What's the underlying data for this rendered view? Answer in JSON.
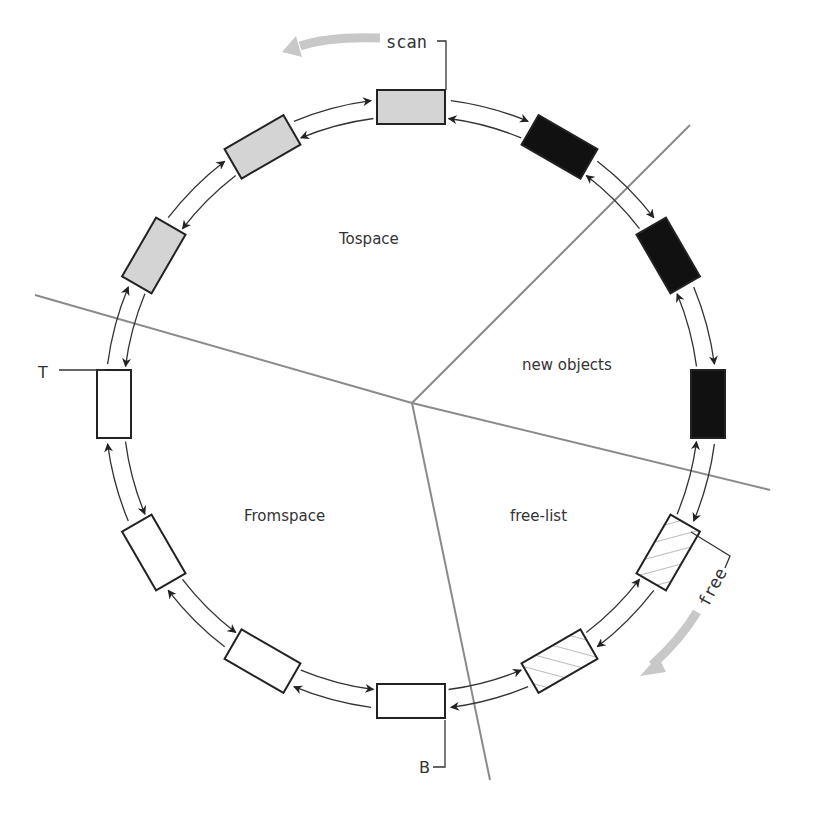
{
  "diagram": {
    "regions": [
      {
        "id": "tospace",
        "label": "Tospace"
      },
      {
        "id": "new-objects",
        "label": "new objects"
      },
      {
        "id": "free-list",
        "label": "free-list"
      },
      {
        "id": "fromspace",
        "label": "Fromspace"
      }
    ],
    "pointers": {
      "scan": "scan",
      "free": "free",
      "top": "T",
      "bottom": "B"
    },
    "blocks": [
      {
        "index": 0,
        "angle": -90,
        "fill": "grey",
        "region": "tospace"
      },
      {
        "index": 1,
        "angle": -60,
        "fill": "black",
        "region": "new-objects"
      },
      {
        "index": 2,
        "angle": -30,
        "fill": "black",
        "region": "new-objects"
      },
      {
        "index": 3,
        "angle": 0,
        "fill": "black",
        "region": "new-objects"
      },
      {
        "index": 4,
        "angle": 30,
        "fill": "hatched",
        "region": "free-list"
      },
      {
        "index": 5,
        "angle": 60,
        "fill": "hatched",
        "region": "free-list"
      },
      {
        "index": 6,
        "angle": 90,
        "fill": "white",
        "region": "fromspace"
      },
      {
        "index": 7,
        "angle": 120,
        "fill": "white",
        "region": "fromspace"
      },
      {
        "index": 8,
        "angle": 150,
        "fill": "white",
        "region": "fromspace"
      },
      {
        "index": 9,
        "angle": 180,
        "fill": "white",
        "region": "fromspace"
      },
      {
        "index": 10,
        "angle": 210,
        "fill": "grey",
        "region": "tospace"
      },
      {
        "index": 11,
        "angle": 240,
        "fill": "grey",
        "region": "tospace"
      }
    ],
    "colors": {
      "grey_block": "#d4d4d4",
      "black_block": "#111111",
      "white_block": "#ffffff",
      "divider": "#8a8a8a",
      "motion_arrow": "#c8c8c8",
      "stroke": "#222222"
    }
  }
}
